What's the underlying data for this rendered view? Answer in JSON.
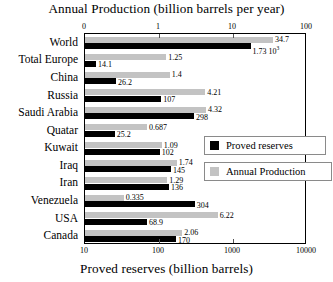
{
  "chart_data": {
    "type": "bar",
    "orientation": "horizontal",
    "title": "",
    "top_axis": {
      "label": "Annual Production (billion barrels per year)",
      "scale": "log",
      "ticks": [
        "0",
        "1",
        "10",
        "100"
      ],
      "tick_values": [
        0.1,
        1,
        10,
        100
      ],
      "range": [
        0.1,
        100
      ]
    },
    "bottom_axis": {
      "label": "Proved reserves (billion barrels)",
      "scale": "log",
      "ticks": [
        "10",
        "100",
        "1000",
        "10000"
      ],
      "tick_values": [
        10,
        100,
        1000,
        10000
      ],
      "range": [
        10,
        10000
      ]
    },
    "categories": [
      "World",
      "Total Europe",
      "China",
      "Russia",
      "Saudi Arabia",
      "Quatar",
      "Kuwait",
      "Iraq",
      "Iran",
      "Venezuela",
      "USA",
      "Canada"
    ],
    "series": [
      {
        "name": "Annual Production",
        "color": "#c3c3c3",
        "unit": "billion barrels per year",
        "axis": "top",
        "values": [
          34.7,
          1.25,
          1.4,
          4.21,
          4.32,
          0.687,
          1.09,
          1.74,
          1.29,
          0.335,
          6.22,
          2.06
        ],
        "labels": [
          "34.7",
          "1.25",
          "1.4",
          "4.21",
          "4.32",
          "0.687",
          "1.09",
          "1.74",
          "1.29",
          "0.335",
          "6.22",
          "2.06"
        ]
      },
      {
        "name": "Proved reserves",
        "color": "#000000",
        "unit": "billion barrels",
        "axis": "bottom",
        "values": [
          1730,
          14.1,
          26.2,
          107,
          298,
          25.2,
          102,
          145,
          136,
          304,
          68.9,
          170
        ],
        "labels": [
          "1.73 10",
          "14.1",
          "26.2",
          "107",
          "298",
          "25.2",
          "102",
          "145",
          "136",
          "304",
          "68.9",
          "170"
        ],
        "label_exponents": [
          "3",
          "",
          "",
          "",
          "",
          "",
          "",
          "",
          "",
          "",
          "",
          ""
        ]
      }
    ],
    "legend": {
      "position": "middle-right",
      "entries": [
        {
          "label": "Proved reserves",
          "color": "#000000"
        },
        {
          "label": "Annual Production",
          "color": "#c3c3c3"
        }
      ]
    },
    "grid": false
  }
}
